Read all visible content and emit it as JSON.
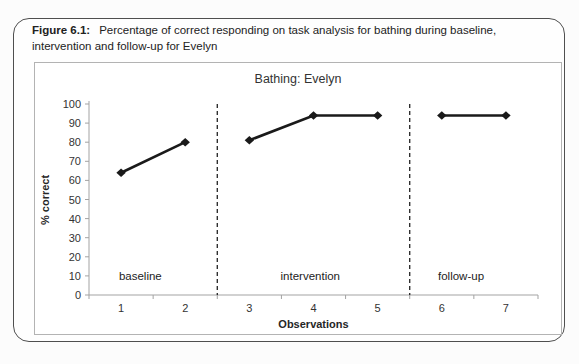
{
  "figure": {
    "caption_prefix": "Figure 6.1:",
    "caption_text": "Percentage of correct responding on task analysis for bathing during baseline, intervention and follow-up for Evelyn"
  },
  "chart_data": {
    "type": "line",
    "title": "Bathing: Evelyn",
    "xlabel": "Observations",
    "ylabel": "% correct",
    "categories": [
      "1",
      "2",
      "3",
      "4",
      "5",
      "6",
      "7"
    ],
    "ylim": [
      0,
      100
    ],
    "y_ticks": [
      0,
      10,
      20,
      30,
      40,
      50,
      60,
      70,
      80,
      90,
      100
    ],
    "grid": false,
    "legend": "none",
    "marker": "diamond",
    "colors": {
      "series": "#1a1a1a",
      "axis": "#a3a3a3",
      "divider": "#222222",
      "text": "#333333"
    },
    "phase_label_y": 8,
    "phases": [
      {
        "label": "baseline",
        "x": [
          1,
          2
        ],
        "values": [
          64,
          80
        ],
        "label_x": 1.3
      },
      {
        "label": "intervention",
        "x": [
          3,
          4,
          5
        ],
        "values": [
          81,
          94,
          94
        ],
        "label_x": 3.95
      },
      {
        "label": "follow-up",
        "x": [
          6,
          7
        ],
        "values": [
          94,
          94
        ],
        "label_x": 6.3
      }
    ],
    "dividers": [
      2.5,
      5.5
    ]
  }
}
